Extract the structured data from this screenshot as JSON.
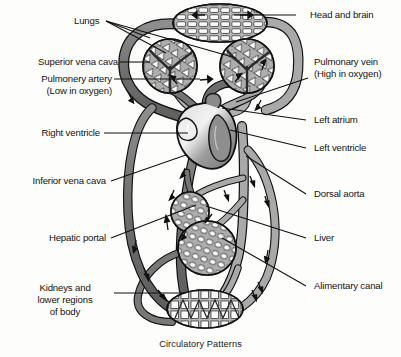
{
  "figure": {
    "caption": "Circulatory Patterns",
    "colors": {
      "deoxygenated_vessel": "#7b7b7b",
      "oxygenated_vessel": "#a9a9a9",
      "heart": "#9a9a9a",
      "outline": "#111111",
      "background": "#fdfdfb",
      "text": "#141414"
    }
  },
  "labels": {
    "lungs": "Lungs",
    "superior_vena_cava": "Superior vena cava",
    "pulmonary_artery_line1": "Pulmonery artery",
    "pulmonary_artery_line2": "(Low in oxygen)",
    "right_ventricle": "Right ventricle",
    "inferior_vena_cava": "Inferior vena cava",
    "hepatic_portal": "Hepatic portal",
    "kidneys_line1": "Kidneys and",
    "kidneys_line2": "lower regions",
    "kidneys_line3": "of body",
    "head_and_brain": "Head and brain",
    "pulmonary_vein_line1": "Pulmonary vein",
    "pulmonary_vein_line2": "(High in oxygen)",
    "left_atrium": "Left atrium",
    "left_ventricle": "Left ventricle",
    "dorsal_aorta": "Dorsal aorta",
    "liver": "Liver",
    "alimentary_canal": "Alimentary canal"
  },
  "organs": {
    "head_and_brain": "head-and-brain-capillary-bed",
    "left_lung": "left-lung-capillary-bed",
    "right_lung": "right-lung-capillary-bed",
    "heart": "heart",
    "liver": "liver-capillary-bed",
    "alimentary_canal": "alimentary-canal-capillary-bed",
    "kidneys": "kidneys-capillary-bed"
  }
}
